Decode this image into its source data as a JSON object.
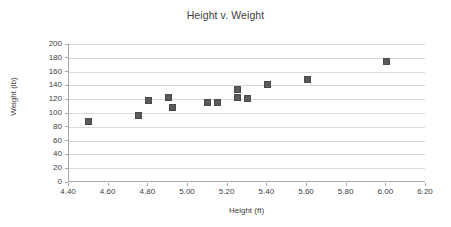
{
  "chart_data": {
    "type": "scatter",
    "title": "Height v. Weight",
    "xlabel": "Height (ft)",
    "ylabel": "Weight (lb)",
    "xlim": [
      4.4,
      6.2
    ],
    "ylim": [
      0,
      200
    ],
    "xticks": [
      "4.40",
      "4.60",
      "4.80",
      "5.00",
      "5.20",
      "5.40",
      "5.60",
      "5.80",
      "6.00",
      "6.20"
    ],
    "xtick_values": [
      4.4,
      4.6,
      4.8,
      5.0,
      5.2,
      5.4,
      5.6,
      5.8,
      6.0,
      6.2
    ],
    "yticks": [
      "200",
      "180",
      "160",
      "140",
      "120",
      "100",
      "80",
      "60",
      "40",
      "20",
      "0"
    ],
    "ytick_values": [
      200,
      180,
      160,
      140,
      120,
      100,
      80,
      60,
      40,
      20,
      0
    ],
    "grid": true,
    "grid_axis": "y",
    "legend": false,
    "marker": "square",
    "marker_color": "#5a5a5a",
    "series": [
      {
        "name": "Height v. Weight",
        "points": [
          {
            "x": 4.5,
            "y": 88
          },
          {
            "x": 4.75,
            "y": 97
          },
          {
            "x": 4.8,
            "y": 118
          },
          {
            "x": 4.9,
            "y": 122
          },
          {
            "x": 4.92,
            "y": 108
          },
          {
            "x": 5.1,
            "y": 115
          },
          {
            "x": 5.15,
            "y": 115
          },
          {
            "x": 5.25,
            "y": 134
          },
          {
            "x": 5.25,
            "y": 123
          },
          {
            "x": 5.3,
            "y": 121
          },
          {
            "x": 5.4,
            "y": 142
          },
          {
            "x": 5.6,
            "y": 149
          },
          {
            "x": 6.0,
            "y": 174
          }
        ]
      }
    ]
  },
  "colors": {
    "marker": "#5a5a5a",
    "gridline": "#d9d9d9",
    "axis": "#a6a6a6",
    "text": "#404040",
    "background": "#ffffff"
  }
}
